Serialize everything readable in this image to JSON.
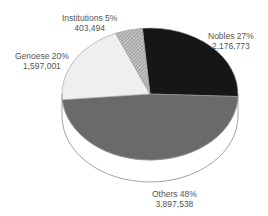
{
  "chart_data": {
    "type": "pie",
    "title": "",
    "style": "3d-tilted",
    "slices": [
      {
        "name": "Nobles",
        "percent": 27,
        "value": 2176773,
        "value_label": "2,176,773",
        "label": "Nobles 27%",
        "color": "#161616"
      },
      {
        "name": "Others",
        "percent": 48,
        "value": 3897538,
        "value_label": "3,897,538",
        "label": "Others 48%",
        "color": "#6a6a6a"
      },
      {
        "name": "Genoese",
        "percent": 20,
        "value": 1597001,
        "value_label": "1,597,001",
        "label": "Genoese 20%",
        "color": "#efefef"
      },
      {
        "name": "Institutions",
        "percent": 5,
        "value": 403494,
        "value_label": "403,494",
        "label": "Institutions 5%",
        "color": "#a8a8a8",
        "pattern": "hatched"
      }
    ],
    "legend": "none",
    "start_angle_deg": -5,
    "direction": "clockwise"
  },
  "labels": {
    "nobles": {
      "name": "Nobles 27%",
      "value": "2,176,773"
    },
    "others": {
      "name": "Others 48%",
      "value": "3,897,538"
    },
    "genoese": {
      "name": "Genoese 20%",
      "value": "1,597,001"
    },
    "institutions": {
      "name": "Institutions 5%",
      "value": "403,494"
    }
  }
}
